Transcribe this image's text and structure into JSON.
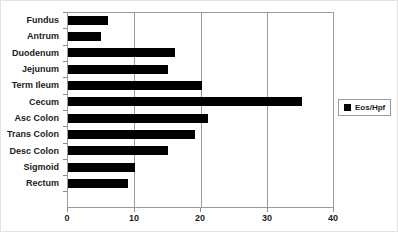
{
  "chart_data": {
    "type": "bar",
    "orientation": "horizontal",
    "title": "",
    "xlabel": "",
    "ylabel": "",
    "xlim": [
      0,
      40
    ],
    "xticks": [
      0,
      10,
      20,
      30,
      40
    ],
    "grid": true,
    "legend_position": "right",
    "bar_color": "#000000",
    "categories": [
      "Fundus",
      "Antrum",
      "Duodenum",
      "Jejunum",
      "Term Ileum",
      "Cecum",
      "Asc Colon",
      "Trans Colon",
      "Desc Colon",
      "Sigmoid",
      "Rectum"
    ],
    "series": [
      {
        "name": "Eos/Hpf",
        "values": [
          6,
          5,
          16,
          15,
          20,
          35,
          21,
          19,
          15,
          10,
          9
        ]
      }
    ]
  },
  "legend": {
    "entries": [
      {
        "label": "Eos/Hpf",
        "color": "#000000"
      }
    ]
  },
  "axis": {
    "x_tick_labels": [
      "0",
      "10",
      "20",
      "30",
      "40"
    ]
  }
}
